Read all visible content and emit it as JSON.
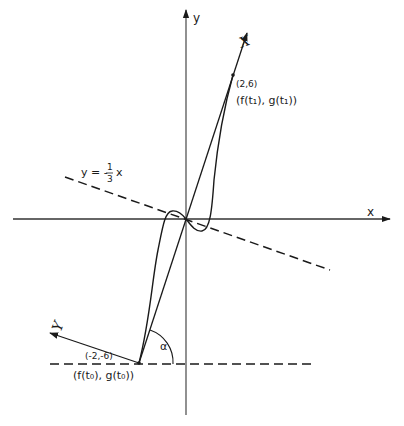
{
  "diagram": {
    "axes": {
      "x_label": "x",
      "y_label": "y"
    },
    "rotated_axes": {
      "X_label": "X",
      "Y_label": "Y"
    },
    "line_label": "y = -⅓ x",
    "line_label_parts": {
      "lhs": "y = -",
      "num": "1",
      "den": "3",
      "rhs": "x"
    },
    "angle_label": "α",
    "point_top": {
      "coords": "(2,6)",
      "param": "(f(t₁), g(t₁))"
    },
    "point_bottom": {
      "coords": "(-2,-6)",
      "param": "(f(t₀), g(t₀))"
    }
  },
  "colors": {
    "ink": "#1a1a1a",
    "axis": "#555555",
    "background": "#ffffff"
  }
}
